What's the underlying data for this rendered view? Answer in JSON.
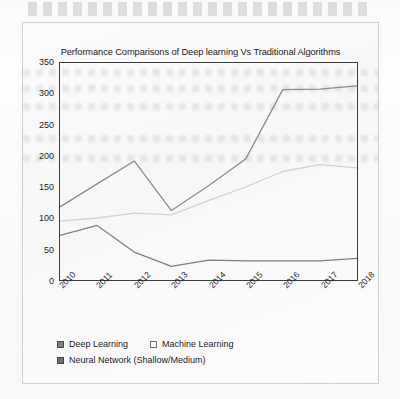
{
  "figure": {
    "title": "Performance Comparisons of Deep learning Vs Traditional Algorithms"
  },
  "legend": {
    "position": "bottom-left",
    "rows": [
      [
        {
          "label": "Deep Learning",
          "swatch_color": "#808080",
          "swatch_border": "#4a4a4a"
        },
        {
          "label": "Machine Learning",
          "swatch_color": "#fdfdfd",
          "swatch_border": "#6e6e6e"
        }
      ],
      [
        {
          "label": "Neural Network (Shallow/Medium)",
          "swatch_color": "#6f6f6f",
          "swatch_border": "#454545"
        }
      ]
    ]
  },
  "chart_data": {
    "type": "line",
    "title": "Performance Comparisons of Deep learning Vs Traditional Algorithms",
    "xlabel": "",
    "ylabel": "",
    "categories": [
      "2010",
      "2011",
      "2012",
      "2013",
      "2014",
      "2015",
      "2016",
      "2017",
      "2018"
    ],
    "ylim": [
      0,
      350
    ],
    "yticks": [
      0,
      50,
      100,
      150,
      200,
      250,
      300,
      350
    ],
    "grid": false,
    "legend_position": "bottom-left",
    "series": [
      {
        "name": "Deep Learning",
        "color": "#8a8a8a",
        "values": [
          118,
          155,
          192,
          112,
          152,
          195,
          307,
          308,
          313
        ]
      },
      {
        "name": "Machine Learning",
        "color": "#d2d2d2",
        "values": [
          95,
          100,
          108,
          105,
          128,
          150,
          175,
          186,
          181
        ]
      },
      {
        "name": "Neural Network (Shallow/Medium)",
        "color": "#7e7e7e",
        "values": [
          72,
          88,
          45,
          22,
          32,
          31,
          31,
          31,
          35
        ]
      }
    ]
  }
}
